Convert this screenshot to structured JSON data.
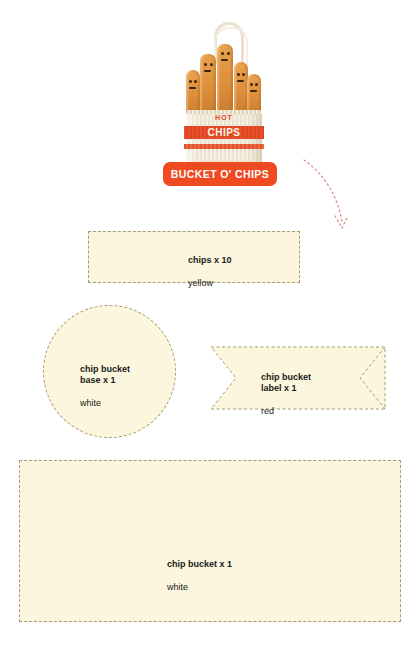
{
  "product": {
    "badge_label": "BUCKET O' CHIPS",
    "bucket_text_top": "HOT",
    "bucket_text_main": "CHIPS",
    "accent_color": "#f04a23",
    "piece_fill_color": "#fbf6dd",
    "piece_border_color": "#a89a72",
    "arrow_color": "#d99a9a"
  },
  "pieces": [
    {
      "id": "chips",
      "shape": "rectangle",
      "title": "chips x 10",
      "color": "yellow",
      "quantity": 10
    },
    {
      "id": "chip-bucket-base",
      "shape": "circle",
      "title": "chip bucket\nbase x 1",
      "color": "white",
      "quantity": 1
    },
    {
      "id": "chip-bucket-label",
      "shape": "banner",
      "title": "chip bucket\nlabel x 1",
      "color": "red",
      "quantity": 1
    },
    {
      "id": "chip-bucket",
      "shape": "rectangle",
      "title": "chip bucket x 1",
      "color": "white",
      "quantity": 1
    }
  ],
  "icons": {
    "arrow": "curved-dotted-arrow-icon",
    "hanger": "hanging-loop-icon"
  }
}
